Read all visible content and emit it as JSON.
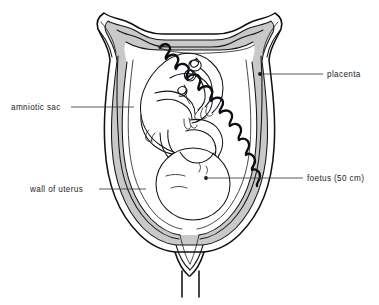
{
  "figure": {
    "background_color": "#ffffff",
    "ink_color": "#101114",
    "shading_color": "#c9c9c9",
    "label_color": "#24252a",
    "width": 379,
    "height": 305
  },
  "labels": [
    {
      "id": "placenta",
      "text": "placenta",
      "side": "right",
      "text_x": 327,
      "text_y": 77,
      "line_x1": 323,
      "line_y1": 74,
      "line_x2": 268,
      "line_y2": 74,
      "dot_x": 260,
      "dot_y": 74
    },
    {
      "id": "amniotic-sac",
      "text": "amniotic sac",
      "side": "left",
      "text_x": 11,
      "text_y": 110,
      "line_x1": 71,
      "line_y1": 107,
      "line_x2": 134,
      "line_y2": 107,
      "dot_x": 0,
      "dot_y": 0
    },
    {
      "id": "foetus",
      "text": "foetus (50 cm)",
      "side": "right",
      "text_x": 307,
      "text_y": 181,
      "line_x1": 303,
      "line_y1": 178,
      "line_x2": 213,
      "line_y2": 178,
      "dot_x": 206,
      "dot_y": 178
    },
    {
      "id": "wall-of-uterus",
      "text": "wall of uterus",
      "side": "left",
      "text_x": 30,
      "text_y": 192,
      "line_x1": 99,
      "line_y1": 189,
      "line_x2": 146,
      "line_y2": 189,
      "dot_x": 0,
      "dot_y": 0
    }
  ],
  "parts": [
    {
      "id": "uterus-wall",
      "name": "wall of uterus"
    },
    {
      "id": "myometrium-shading",
      "name": "uterine muscle shading"
    },
    {
      "id": "amniotic-sac-membrane",
      "name": "amniotic sac"
    },
    {
      "id": "amniotic-cavity",
      "name": "amniotic cavity"
    },
    {
      "id": "placenta-body",
      "name": "placenta"
    },
    {
      "id": "placental-villi",
      "name": "placental villi border"
    },
    {
      "id": "foetus-body",
      "name": "foetus"
    },
    {
      "id": "foetal-head",
      "name": "foetal head"
    },
    {
      "id": "umbilical-cord",
      "name": "umbilical cord"
    },
    {
      "id": "cervix",
      "name": "cervix"
    },
    {
      "id": "vaginal-canal",
      "name": "vaginal canal"
    },
    {
      "id": "fallopian-horn-left",
      "name": "left uterine horn"
    },
    {
      "id": "fallopian-horn-right",
      "name": "right uterine horn"
    }
  ]
}
